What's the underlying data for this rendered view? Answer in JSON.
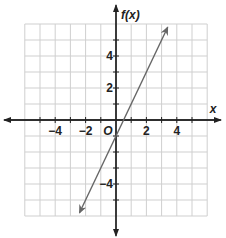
{
  "chart_data": {
    "type": "line",
    "title": "",
    "xlabel": "x",
    "ylabel": "f(x)",
    "xlim": [
      -6,
      6
    ],
    "ylim": [
      -6,
      6
    ],
    "grid": true,
    "x_ticks": [
      -4,
      -2,
      2,
      4
    ],
    "y_ticks": [
      4,
      2,
      -4
    ],
    "x_tick_labels": [
      "−4",
      "−2",
      "2",
      "4"
    ],
    "y_tick_labels": [
      "4",
      "2",
      "−4"
    ],
    "origin_label": "O",
    "series": [
      {
        "name": "f(x) = 2x - 1",
        "equation": "2x - 1",
        "slope": 2,
        "intercept": -1,
        "x": [
          -2.4,
          3.4
        ],
        "y": [
          -5.8,
          5.8
        ],
        "arrows": "both",
        "color": "#666666"
      }
    ]
  },
  "labels": {
    "x_axis": "x",
    "y_axis": "f(x)",
    "origin": "O"
  }
}
